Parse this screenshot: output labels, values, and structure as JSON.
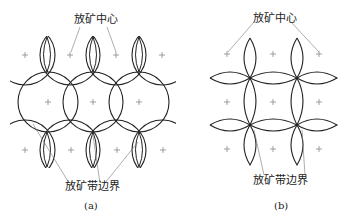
{
  "figure_a": {
    "label_top": "放矿中心",
    "label_bottom": "放矿带边界",
    "caption": "(a)"
  },
  "figure_b": {
    "label_top": "放矿中心",
    "label_bottom": "放矿带边界",
    "caption": "(b)"
  },
  "colors": {
    "line": "#222222",
    "plus": "#888888",
    "leader": "#777777"
  }
}
